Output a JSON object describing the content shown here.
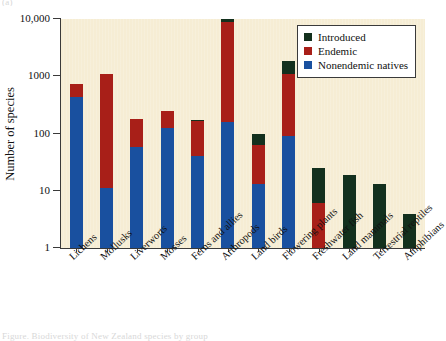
{
  "figure": {
    "top_fragment": "(a)",
    "bottom_fragment": "Figure. Biodiversity of New Zealand species by group"
  },
  "legend": {
    "position": "top-right",
    "items": [
      {
        "label": "Introduced",
        "color": "#13301d",
        "swatch_name": "legend-swatch-introduced"
      },
      {
        "label": "Endemic",
        "color": "#a81f18",
        "swatch_name": "legend-swatch-endemic"
      },
      {
        "label": "Nonendemic natives",
        "color": "#19509f",
        "swatch_name": "legend-swatch-nonendemic"
      }
    ]
  },
  "axes": {
    "ylabel": "Number of species",
    "yticks": [
      "10,000",
      "1000",
      "100",
      "10",
      "1"
    ],
    "ytick_values": [
      10000,
      1000,
      100,
      10,
      1
    ],
    "ylim": [
      1,
      10000
    ],
    "yscale": "log",
    "xlabel": "",
    "grid": false,
    "plot_background": "#f6edd4"
  },
  "chart_data": {
    "type": "bar",
    "title": "",
    "subtitle": "",
    "xlabel": "",
    "ylabel": "Number of species",
    "yscale": "log",
    "ylim": [
      1,
      10000
    ],
    "grid": false,
    "legend_position": "top-right",
    "stacked": true,
    "categories": [
      "Lichens",
      "Mollusks",
      "Liverworts",
      "Mosses",
      "Ferns and allies",
      "Arthropods",
      "Land birds",
      "Flowering plants",
      "Freshwater fish",
      "Land mammals",
      "Terrestrial reptiles",
      "Amphibians"
    ],
    "series": [
      {
        "name": "Nonendemic natives",
        "color": "#19509f",
        "cumulative_top": [
          430,
          11,
          57,
          125,
          40,
          160,
          13,
          90,
          0,
          0,
          0,
          0
        ],
        "values": [
          430,
          11,
          57,
          125,
          40,
          160,
          13,
          90,
          0,
          0,
          0,
          0
        ]
      },
      {
        "name": "Endemic",
        "color": "#a81f18",
        "cumulative_top": [
          720,
          1100,
          180,
          245,
          165,
          9000,
          62,
          1100,
          6,
          0,
          0,
          0
        ],
        "values": [
          290,
          1089,
          123,
          120,
          125,
          8840,
          49,
          1010,
          6,
          0,
          0,
          0
        ]
      },
      {
        "name": "Introduced",
        "color": "#13301d",
        "cumulative_top": [
          720,
          1100,
          180,
          245,
          175,
          10000,
          98,
          1850,
          25,
          19,
          13,
          4
        ],
        "values": [
          0,
          0,
          0,
          0,
          10,
          1000,
          36,
          750,
          19,
          19,
          13,
          4
        ]
      }
    ],
    "totals": [
      720,
      1100,
      180,
      245,
      175,
      10000,
      98,
      1850,
      25,
      19,
      13,
      4
    ]
  }
}
